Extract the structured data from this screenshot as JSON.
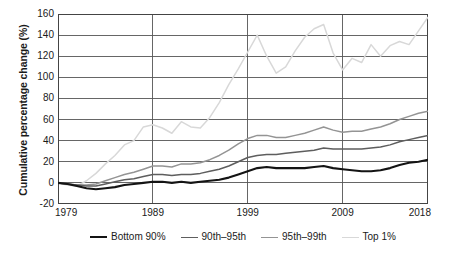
{
  "chart_data": {
    "type": "line",
    "title": "",
    "xlabel": "",
    "ylabel": "Cumulative percentage change (%)",
    "xlim": [
      1979,
      2018
    ],
    "ylim": [
      -20,
      160
    ],
    "grid": true,
    "legend_position": "bottom",
    "yticks": [
      160,
      140,
      120,
      100,
      80,
      60,
      40,
      20,
      0,
      -20
    ],
    "ytick_labels": [
      "160",
      "140",
      "120",
      "100",
      "80",
      "60",
      "40",
      "20",
      "0",
      "-20"
    ],
    "xticks": [
      1979,
      1989,
      1999,
      2009,
      2018
    ],
    "xtick_labels": [
      "1979",
      "1989",
      "1999",
      "2009",
      "2018"
    ],
    "x": [
      1979,
      1980,
      1981,
      1982,
      1983,
      1984,
      1985,
      1986,
      1987,
      1988,
      1989,
      1990,
      1991,
      1992,
      1993,
      1994,
      1995,
      1996,
      1997,
      1998,
      1999,
      2000,
      2001,
      2002,
      2003,
      2004,
      2005,
      2006,
      2007,
      2008,
      2009,
      2010,
      2011,
      2012,
      2013,
      2014,
      2015,
      2016,
      2017,
      2018
    ],
    "series": [
      {
        "name": "Bottom 90%",
        "color": "#141414",
        "width": 2.1,
        "values": [
          0,
          -1,
          -3,
          -5,
          -6,
          -5,
          -4,
          -2,
          -1,
          0,
          1,
          1,
          0,
          1,
          0,
          1,
          2,
          3,
          5,
          8,
          11,
          14,
          15,
          14,
          14,
          14,
          14,
          15,
          16,
          14,
          13,
          12,
          11,
          11,
          12,
          14,
          17,
          19,
          20,
          22
        ]
      },
      {
        "name": "90th–95th",
        "color": "#5e5e5e",
        "width": 1.5,
        "values": [
          0,
          -1,
          -2,
          -3,
          -3,
          -1,
          1,
          3,
          4,
          6,
          8,
          8,
          7,
          8,
          8,
          9,
          11,
          13,
          16,
          20,
          24,
          26,
          27,
          27,
          28,
          29,
          30,
          31,
          33,
          32,
          32,
          32,
          32,
          33,
          34,
          36,
          39,
          41,
          43,
          45
        ]
      },
      {
        "name": "95th–99th",
        "color": "#949494",
        "width": 1.5,
        "values": [
          0,
          -1,
          -2,
          -2,
          -1,
          2,
          5,
          8,
          10,
          13,
          16,
          16,
          15,
          18,
          18,
          19,
          22,
          26,
          31,
          37,
          42,
          45,
          45,
          43,
          43,
          45,
          47,
          50,
          53,
          50,
          48,
          49,
          49,
          51,
          53,
          56,
          60,
          63,
          66,
          68
        ]
      },
      {
        "name": "Top 1%",
        "color": "#d8d8d8",
        "width": 1.5,
        "values": [
          0,
          -2,
          -3,
          2,
          9,
          18,
          26,
          36,
          40,
          53,
          55,
          52,
          47,
          58,
          53,
          52,
          62,
          76,
          93,
          108,
          124,
          140,
          120,
          104,
          110,
          125,
          138,
          146,
          150,
          123,
          107,
          118,
          114,
          131,
          120,
          130,
          134,
          131,
          144,
          157
        ]
      }
    ]
  },
  "legend": {
    "entries": [
      {
        "label": "Bottom 90%"
      },
      {
        "label": "90th–95th"
      },
      {
        "label": "95th–99th"
      },
      {
        "label": "Top 1%"
      }
    ]
  }
}
